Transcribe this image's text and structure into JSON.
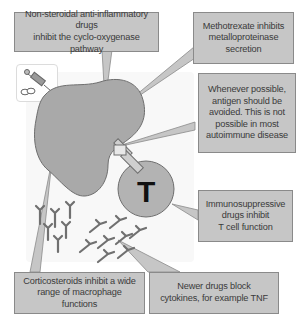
{
  "diagram": {
    "type": "immunology-drug-targets",
    "callouts": {
      "nsaids": {
        "line1": "Non-steroidal anti-inflammatory drugs",
        "line2": "inhibit the cyclo-oxygenase pathway"
      },
      "methotrexate": {
        "line1": "Methotrexate inhibits",
        "line2": "metalloproteinase",
        "line3": "secretion"
      },
      "antigen": {
        "line1": "Whenever possible,",
        "line2": "antigen should be",
        "line3": "avoided. This is not",
        "line4": "possible in most",
        "line5": "autoimmune disease"
      },
      "immunosuppressive": {
        "line1": "Immunosuppressive",
        "line2": "drugs inhibit",
        "line3": "T cell function"
      },
      "corticosteroids": {
        "line1": "Corticosteroids inhibit a wide",
        "line2": "range of macrophage functions"
      },
      "newer_drugs": {
        "line1": "Newer drugs block",
        "line2": "cytokines, for example TNF"
      }
    },
    "cells": {
      "t_cell_label": "T",
      "macrophage": "macrophage",
      "cytokines": "cytokine molecules"
    },
    "icons": {
      "drug": "syringe-and-pills-icon"
    },
    "colors": {
      "callout_fill": "#c6c6c6",
      "callout_border": "#8a8a8a",
      "cell_fill": "#a9a9a9",
      "cell_stroke": "#6e6e6e",
      "text": "#3a3a3a"
    }
  }
}
